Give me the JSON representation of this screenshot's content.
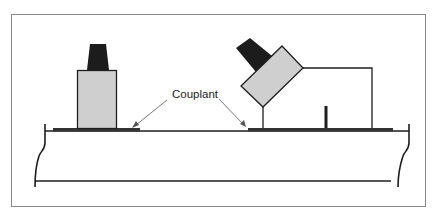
{
  "diagram": {
    "labels": {
      "couplant": "Couplant"
    },
    "colors": {
      "frame": "#8a8a8a",
      "line": "#1e1e1e",
      "probe_fill": "#cfcfcf",
      "cap_fill": "#1c1c1c",
      "couplant_fill": "#333333",
      "background": "#ffffff"
    },
    "components": [
      {
        "id": "straight-beam-probe",
        "type": "transducer",
        "orientation": "vertical"
      },
      {
        "id": "angle-beam-probe",
        "type": "transducer",
        "orientation": "angled",
        "mounted_on": "wedge"
      },
      {
        "id": "left-couplant-layer",
        "type": "couplant"
      },
      {
        "id": "right-couplant-layer",
        "type": "couplant"
      },
      {
        "id": "test-piece",
        "type": "material-section"
      }
    ]
  }
}
